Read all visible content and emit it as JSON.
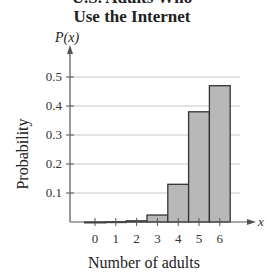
{
  "chart_data": {
    "type": "bar",
    "title_lines": [
      "U.S. Adults Who",
      "Use the Internet"
    ],
    "xlabel": "Number of adults",
    "ylabel": "Probability",
    "y_axis_symbol": "P(x)",
    "x_axis_symbol": "x",
    "categories": [
      "0",
      "1",
      "2",
      "3",
      "4",
      "5",
      "6"
    ],
    "values": [
      0.0,
      0.001,
      0.004,
      0.024,
      0.13,
      0.38,
      0.47
    ],
    "yticks": [
      "0.1",
      "0.2",
      "0.3",
      "0.4",
      "0.5"
    ],
    "ylim": [
      0,
      0.55
    ],
    "grid": true,
    "bar_color": "#b8b8b8",
    "bar_edge_color": "#333333",
    "grid_color": "#c8c8c8"
  }
}
